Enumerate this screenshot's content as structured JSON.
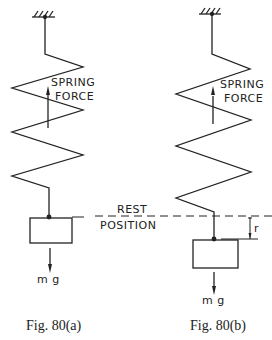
{
  "figures": [
    {
      "id": "a",
      "caption": "Fig. 80(a)",
      "force_label_line1": "SPRING",
      "force_label_line2": "FORCE",
      "weight_label": "m g"
    },
    {
      "id": "b",
      "caption": "Fig. 80(b)",
      "force_label_line1": "SPRING",
      "force_label_line2": "FORCE",
      "weight_label": "m g",
      "displacement_label": "r"
    }
  ],
  "rest_line": {
    "label_line1": "REST",
    "label_line2": "POSITION"
  },
  "colors": {
    "ink": "#222222",
    "background": "#ffffff"
  }
}
